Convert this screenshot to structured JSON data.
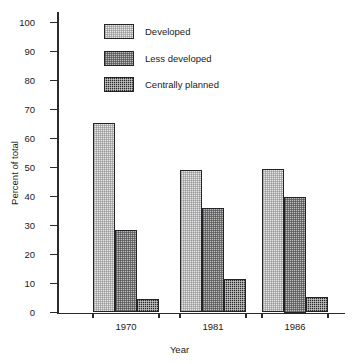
{
  "chart_data": {
    "type": "bar",
    "title": "",
    "xlabel": "Year",
    "ylabel": "Percent of total",
    "categories": [
      "1970",
      "1981",
      "1986"
    ],
    "series": [
      {
        "name": "Developed",
        "values": [
          65.5,
          49.0,
          49.5
        ],
        "pattern": "light-dotted",
        "color": "#e6e6e6"
      },
      {
        "name": "Less developed",
        "values": [
          28.5,
          36.0,
          40.0
        ],
        "pattern": "medium-checker",
        "color": "#b9b9b9"
      },
      {
        "name": "Centrally planned",
        "values": [
          4.5,
          11.7,
          5.5
        ],
        "pattern": "dark-checker",
        "color": "#2c2c2c"
      }
    ],
    "ylim": [
      0,
      100
    ],
    "yticks": [
      0,
      10,
      20,
      30,
      40,
      50,
      60,
      70,
      80,
      90,
      100
    ],
    "ytick_labels": [
      "0",
      "10",
      "20",
      "30",
      "40",
      "50",
      "60",
      "70",
      "80",
      "90",
      "100"
    ],
    "grid": false,
    "legend_position": "top-left-inside"
  },
  "legend": {
    "items": [
      {
        "label": "Developed"
      },
      {
        "label": "Less developed"
      },
      {
        "label": "Centrally planned"
      }
    ]
  },
  "axes": {
    "y_title": "Percent of total",
    "x_title": "Year"
  }
}
